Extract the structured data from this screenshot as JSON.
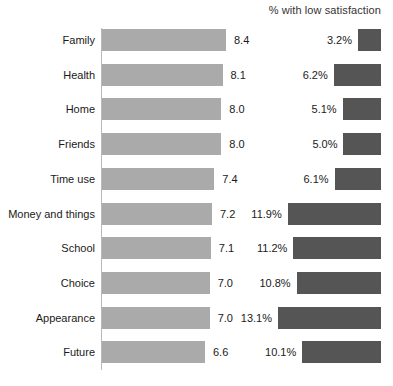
{
  "chart_data": {
    "type": "bar",
    "title": "",
    "panels": [
      {
        "name": "satisfaction-score",
        "title": "",
        "xlabel": "",
        "ylabel": "",
        "value_format": "0.0"
      },
      {
        "name": "low-satisfaction-percent",
        "title": "% with low satisfaction",
        "xlabel": "",
        "ylabel": "",
        "value_format": "0.0%"
      }
    ],
    "categories": [
      "Family",
      "Health",
      "Home",
      "Friends",
      "Time use",
      "Money and things",
      "School",
      "Choice",
      "Appearance",
      "Future"
    ],
    "series": [
      {
        "name": "Mean satisfaction score",
        "values": [
          8.4,
          8.1,
          8.0,
          8.0,
          7.4,
          7.2,
          7.1,
          7.0,
          7.0,
          6.6
        ],
        "labels": [
          "8.4",
          "8.1",
          "8.0",
          "8.0",
          "7.4",
          "7.2",
          "7.1",
          "7.0",
          "7.0",
          "6.6"
        ],
        "color": "#aaaaaa"
      },
      {
        "name": "% with low satisfaction",
        "values": [
          3.2,
          6.2,
          5.1,
          5.0,
          6.1,
          11.9,
          11.2,
          10.8,
          13.1,
          10.1
        ],
        "labels": [
          "3.2%",
          "6.2%",
          "5.1%",
          "5.0%",
          "6.1%",
          "11.9%",
          "11.2%",
          "10.8%",
          "13.1%",
          "10.1%"
        ],
        "color": "#555555"
      }
    ],
    "grid": false,
    "legend": "none",
    "axis": {
      "left_axis_line": true,
      "ticks": []
    }
  },
  "colors": {
    "background": "#ffffff",
    "bar_light": "#aaaaaa",
    "bar_dark": "#555555",
    "axis": "#b9b9b9",
    "text": "#1a1a1a"
  }
}
